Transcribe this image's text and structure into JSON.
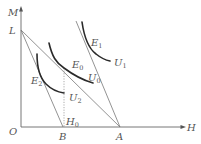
{
  "diagram": {
    "type": "indifference-curve-budget-line diagram",
    "axes": {
      "y_label": "M",
      "x_label": "H",
      "origin_label": "O"
    },
    "points": {
      "L": "L",
      "B": "B",
      "A": "A",
      "H0": {
        "main": "H",
        "sub": "0"
      }
    },
    "curves": [
      {
        "name": "U1",
        "main": "U",
        "sub": "1",
        "tangency": {
          "main": "E",
          "sub": "1"
        }
      },
      {
        "name": "U0",
        "main": "U",
        "sub": "0",
        "tangency": {
          "main": "E",
          "sub": "0"
        }
      },
      {
        "name": "U2",
        "main": "U",
        "sub": "2",
        "tangency": {
          "main": "E",
          "sub": "2"
        }
      }
    ],
    "lines": [
      {
        "name": "LA",
        "from": "L",
        "to": "A"
      },
      {
        "name": "LB",
        "from": "L",
        "to": "B"
      },
      {
        "name": "steep-line-to-A",
        "to": "A"
      }
    ],
    "colors": {
      "curve": "#2a2a2a",
      "line": "#777777",
      "label": "#555555"
    }
  }
}
